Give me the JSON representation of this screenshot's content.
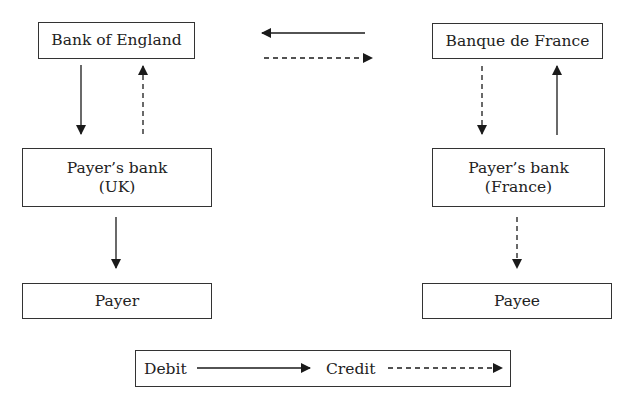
{
  "nodes": {
    "boe": {
      "label": "Bank of England"
    },
    "bdf": {
      "label": "Banque de France"
    },
    "uk_bank": {
      "line1": "Payer’s bank",
      "line2": "(UK)"
    },
    "fr_bank": {
      "line1": "Payer’s bank",
      "line2": "(France)"
    },
    "payer": {
      "label": "Payer"
    },
    "payee": {
      "label": "Payee"
    }
  },
  "edges": [
    {
      "from": "bdf",
      "to": "boe",
      "type": "debit",
      "style": "solid"
    },
    {
      "from": "boe",
      "to": "bdf",
      "type": "credit",
      "style": "dashed"
    },
    {
      "from": "boe",
      "to": "uk_bank",
      "type": "debit",
      "style": "solid"
    },
    {
      "from": "uk_bank",
      "to": "boe",
      "type": "credit",
      "style": "dashed"
    },
    {
      "from": "bdf",
      "to": "fr_bank",
      "type": "credit",
      "style": "dashed"
    },
    {
      "from": "fr_bank",
      "to": "bdf",
      "type": "debit",
      "style": "solid"
    },
    {
      "from": "uk_bank",
      "to": "payer",
      "type": "debit",
      "style": "solid"
    },
    {
      "from": "fr_bank",
      "to": "payee",
      "type": "credit",
      "style": "dashed"
    }
  ],
  "legend": {
    "debit_label": "Debit",
    "credit_label": "Credit"
  },
  "colors": {
    "line": "#1a1a1a",
    "border": "#333333"
  }
}
